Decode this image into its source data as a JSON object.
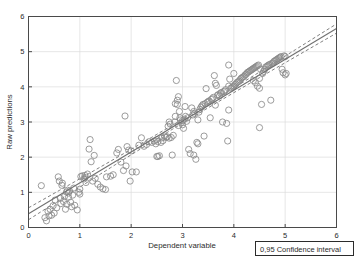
{
  "chart_data": {
    "type": "scatter",
    "title": "",
    "xlabel": "Dependent variable",
    "ylabel": "Raw predictions",
    "xlim": [
      0,
      6
    ],
    "ylim": [
      0,
      6
    ],
    "xticks": [
      "0",
      "1",
      "2",
      "3",
      "4",
      "5",
      "6"
    ],
    "yticks": [
      "0",
      "1",
      "2",
      "3",
      "4",
      "5",
      "6"
    ],
    "xtick_values": [
      0,
      1,
      2,
      3,
      4,
      5,
      6
    ],
    "ytick_values": [
      0,
      1,
      2,
      3,
      4,
      5,
      6
    ],
    "grid": true,
    "grid_color": "#dcdcdc",
    "frame_color": "#4a4a4a",
    "marker": "open-circle",
    "marker_color": "#8a8a8a",
    "marker_size": 3.1,
    "legend_position": "below-axes-right",
    "legend_entries": [
      "0,95 Confidence interval"
    ],
    "fit_line": {
      "label": "regression line",
      "style": "solid",
      "color": "#707070",
      "slope": 0.878,
      "intercept": 0.39,
      "x_range": [
        0,
        6
      ]
    },
    "confidence_band": {
      "label": "0,95 Confidence interval",
      "style": "dashed",
      "color": "#707070",
      "level": 0.95,
      "upper_at_x0": 0.56,
      "lower_at_x0": 0.22,
      "upper_at_x6": 5.78,
      "lower_at_x6": 5.5,
      "narrowest_x": 3.1
    },
    "series": [
      {
        "name": "observations",
        "points": [
          [
            0.25,
            1.19
          ],
          [
            0.32,
            0.28
          ],
          [
            0.35,
            0.19
          ],
          [
            0.38,
            0.46
          ],
          [
            0.4,
            0.33
          ],
          [
            0.42,
            0.52
          ],
          [
            0.45,
            0.35
          ],
          [
            0.48,
            0.62
          ],
          [
            0.5,
            0.41
          ],
          [
            0.52,
            0.78
          ],
          [
            0.55,
            0.56
          ],
          [
            0.58,
            1.44
          ],
          [
            0.6,
            1.32
          ],
          [
            0.62,
            0.83
          ],
          [
            0.63,
            0.68
          ],
          [
            0.65,
            1.2
          ],
          [
            0.66,
            1.26
          ],
          [
            0.68,
            0.74
          ],
          [
            0.7,
            0.88
          ],
          [
            0.72,
            0.52
          ],
          [
            0.74,
            1.01
          ],
          [
            0.75,
            0.66
          ],
          [
            0.76,
            1.06
          ],
          [
            0.78,
            0.98
          ],
          [
            0.8,
            1.04
          ],
          [
            0.82,
            0.72
          ],
          [
            0.84,
            0.59
          ],
          [
            0.86,
            0.92
          ],
          [
            0.88,
            1.12
          ],
          [
            0.9,
            0.63
          ],
          [
            0.95,
            0.5
          ],
          [
            0.98,
            1.0
          ],
          [
            1.0,
            0.95
          ],
          [
            1.0,
            1.09
          ],
          [
            1.02,
            1.45
          ],
          [
            1.05,
            1.47
          ],
          [
            1.08,
            1.38
          ],
          [
            1.1,
            1.42
          ],
          [
            1.12,
            1.28
          ],
          [
            1.15,
            1.52
          ],
          [
            1.18,
            2.23
          ],
          [
            1.2,
            2.5
          ],
          [
            1.22,
            1.87
          ],
          [
            1.25,
            1.32
          ],
          [
            1.28,
            2.05
          ],
          [
            1.3,
            1.4
          ],
          [
            1.35,
            1.23
          ],
          [
            1.4,
            1.15
          ],
          [
            1.45,
            1.1
          ],
          [
            1.5,
            1.08
          ],
          [
            1.52,
            1.44
          ],
          [
            1.6,
            1.46
          ],
          [
            1.65,
            1.5
          ],
          [
            1.72,
            2.12
          ],
          [
            1.75,
            2.22
          ],
          [
            1.8,
            1.86
          ],
          [
            1.85,
            1.62
          ],
          [
            1.88,
            3.17
          ],
          [
            1.9,
            1.75
          ],
          [
            1.92,
            2.3
          ],
          [
            1.95,
            2.2
          ],
          [
            1.98,
            1.32
          ],
          [
            2.0,
            2.18
          ],
          [
            2.02,
            1.58
          ],
          [
            2.1,
            1.58
          ],
          [
            2.15,
            2.34
          ],
          [
            2.2,
            2.55
          ],
          [
            2.25,
            2.31
          ],
          [
            2.3,
            2.36
          ],
          [
            2.35,
            2.44
          ],
          [
            2.4,
            2.42
          ],
          [
            2.45,
            2.46
          ],
          [
            2.48,
            2.38
          ],
          [
            2.5,
            2.5
          ],
          [
            2.52,
            2.02
          ],
          [
            2.55,
            2.04
          ],
          [
            2.58,
            2.42
          ],
          [
            2.6,
            2.55
          ],
          [
            2.62,
            2.47
          ],
          [
            2.65,
            2.6
          ],
          [
            2.68,
            2.56
          ],
          [
            2.7,
            2.58
          ],
          [
            2.72,
            2.88
          ],
          [
            2.74,
            3.0
          ],
          [
            2.76,
            2.94
          ],
          [
            2.78,
            2.56
          ],
          [
            2.8,
            2.06
          ],
          [
            2.82,
            2.62
          ],
          [
            2.85,
            3.0
          ],
          [
            2.86,
            3.16
          ],
          [
            2.88,
            4.18
          ],
          [
            2.9,
            3.62
          ],
          [
            2.9,
            3.5
          ],
          [
            2.92,
            3.72
          ],
          [
            2.94,
            3.3
          ],
          [
            2.95,
            3.12
          ],
          [
            2.96,
            3.06
          ],
          [
            2.98,
            2.98
          ],
          [
            3.0,
            2.92
          ],
          [
            3.0,
            3.04
          ],
          [
            3.02,
            2.82
          ],
          [
            3.04,
            3.08
          ],
          [
            3.06,
            3.16
          ],
          [
            3.08,
            3.02
          ],
          [
            3.1,
            3.12
          ],
          [
            3.12,
            2.22
          ],
          [
            3.15,
            2.1
          ],
          [
            3.18,
            3.4
          ],
          [
            3.2,
            3.2
          ],
          [
            3.22,
            3.3
          ],
          [
            3.24,
            3.24
          ],
          [
            3.26,
            1.94
          ],
          [
            3.28,
            2.42
          ],
          [
            3.3,
            2.38
          ],
          [
            3.32,
            3.28
          ],
          [
            3.34,
            3.36
          ],
          [
            3.36,
            3.42
          ],
          [
            3.38,
            3.46
          ],
          [
            3.4,
            3.5
          ],
          [
            3.42,
            2.6
          ],
          [
            3.44,
            3.52
          ],
          [
            3.46,
            3.95
          ],
          [
            3.48,
            3.56
          ],
          [
            3.5,
            3.58
          ],
          [
            3.52,
            3.6
          ],
          [
            3.54,
            3.12
          ],
          [
            3.56,
            3.64
          ],
          [
            3.58,
            3.66
          ],
          [
            3.6,
            3.7
          ],
          [
            3.62,
            4.32
          ],
          [
            3.64,
            4.1
          ],
          [
            3.66,
            4.04
          ],
          [
            3.68,
            3.76
          ],
          [
            3.7,
            3.78
          ],
          [
            3.72,
            3.74
          ],
          [
            3.74,
            3.82
          ],
          [
            3.76,
            3.84
          ],
          [
            3.78,
            3.0
          ],
          [
            3.8,
            3.86
          ],
          [
            3.82,
            3.88
          ],
          [
            3.84,
            3.92
          ],
          [
            3.86,
            2.96
          ],
          [
            3.88,
            2.46
          ],
          [
            3.9,
            3.34
          ],
          [
            3.9,
            4.62
          ],
          [
            3.92,
            4.22
          ],
          [
            3.94,
            3.96
          ],
          [
            3.96,
            3.98
          ],
          [
            3.98,
            4.0
          ],
          [
            4.0,
            4.02
          ],
          [
            4.0,
            4.38
          ],
          [
            4.02,
            4.06
          ],
          [
            4.04,
            4.08
          ],
          [
            4.06,
            4.12
          ],
          [
            4.08,
            4.14
          ],
          [
            4.1,
            4.16
          ],
          [
            4.12,
            4.2
          ],
          [
            4.14,
            4.24
          ],
          [
            4.16,
            4.26
          ],
          [
            4.18,
            4.28
          ],
          [
            4.2,
            4.3
          ],
          [
            4.22,
            4.34
          ],
          [
            4.24,
            4.36
          ],
          [
            4.26,
            4.4
          ],
          [
            4.28,
            4.42
          ],
          [
            4.3,
            4.44
          ],
          [
            4.32,
            4.46
          ],
          [
            4.34,
            4.48
          ],
          [
            4.36,
            4.5
          ],
          [
            4.38,
            4.52
          ],
          [
            4.4,
            4.54
          ],
          [
            4.42,
            4.56
          ],
          [
            4.44,
            4.58
          ],
          [
            4.46,
            4.6
          ],
          [
            4.48,
            4.62
          ],
          [
            4.5,
            3.96
          ],
          [
            4.5,
            2.84
          ],
          [
            4.52,
            4.5
          ],
          [
            4.54,
            3.5
          ],
          [
            4.56,
            4.38
          ],
          [
            4.58,
            4.44
          ],
          [
            4.6,
            4.5
          ],
          [
            4.62,
            4.56
          ],
          [
            4.64,
            4.58
          ],
          [
            4.66,
            4.6
          ],
          [
            4.68,
            4.62
          ],
          [
            4.7,
            4.64
          ],
          [
            4.72,
            3.62
          ],
          [
            4.74,
            4.66
          ],
          [
            4.76,
            4.68
          ],
          [
            4.78,
            4.72
          ],
          [
            4.8,
            4.74
          ],
          [
            4.82,
            4.76
          ],
          [
            4.84,
            4.78
          ],
          [
            4.86,
            4.8
          ],
          [
            4.88,
            4.82
          ],
          [
            4.9,
            4.84
          ],
          [
            4.92,
            4.86
          ],
          [
            4.94,
            4.5
          ],
          [
            4.96,
            4.4
          ],
          [
            4.98,
            4.88
          ],
          [
            5.0,
            4.86
          ],
          [
            5.0,
            4.34
          ],
          [
            5.02,
            4.38
          ],
          [
            2.86,
            3.52
          ],
          [
            3.05,
            3.44
          ],
          [
            3.3,
            3.06
          ],
          [
            2.5,
            2.02
          ],
          [
            2.52,
            2.44
          ],
          [
            3.9,
            4.02
          ],
          [
            4.38,
            4.18
          ],
          [
            4.42,
            4.12
          ],
          [
            4.46,
            4.02
          ],
          [
            4.5,
            4.24
          ],
          [
            3.64,
            3.48
          ],
          [
            3.22,
            2.06
          ],
          [
            2.92,
            2.9
          ],
          [
            2.74,
            2.54
          ],
          [
            1.1,
            1.48
          ],
          [
            0.78,
            0.86
          ]
        ]
      }
    ]
  },
  "axes": {
    "x_title": "Dependent variable",
    "y_title": "Raw predictions"
  },
  "legend": {
    "confidence_label": "0,95 Confidence interval"
  }
}
